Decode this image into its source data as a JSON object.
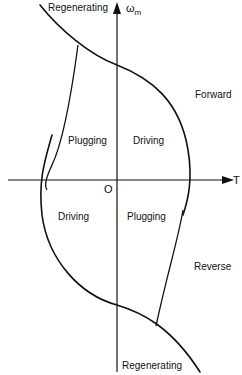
{
  "diagram": {
    "axes": {
      "x_label": "T",
      "y_label": "ω",
      "y_label_sub": "m",
      "origin_label": "O"
    },
    "quadrant_labels": {
      "q1": "Driving",
      "q2": "Plugging",
      "q3": "Driving",
      "q4": "Plugging"
    },
    "region_labels": {
      "top": "Regenerating",
      "bottom": "Regenerating",
      "forward": "Forward",
      "reverse": "Reverse"
    },
    "line_color": "#111111",
    "background": "#ffffff"
  }
}
